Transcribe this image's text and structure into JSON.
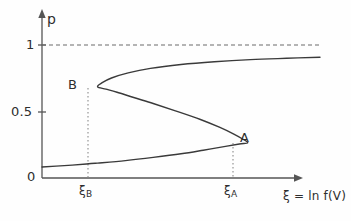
{
  "chart_data": {
    "type": "line",
    "title": "",
    "xlabel": "ξ = ln f(V)",
    "ylabel": "p",
    "xlim": [
      0,
      1
    ],
    "ylim": [
      0,
      1.15
    ],
    "grid": false,
    "legend": null,
    "y_ticks": [
      {
        "value": 1,
        "label": "1"
      },
      {
        "value": 0.5,
        "label": "0.5"
      },
      {
        "value": 0,
        "label": "0"
      }
    ],
    "x_ticks": [
      {
        "label": "ξ",
        "sub": "B",
        "value": 0.2
      },
      {
        "label": "ξ",
        "sub": "A",
        "value": 0.74
      }
    ],
    "annotations": [
      {
        "name": "A",
        "label": "A",
        "x": 0.74,
        "y": 0.265,
        "note": "right fold / turning point"
      },
      {
        "name": "B",
        "label": "B",
        "x": 0.2,
        "y": 0.685,
        "note": "left fold / turning point"
      }
    ],
    "reference_lines": [
      {
        "name": "p-equals-one",
        "orientation": "horizontal",
        "value": 1,
        "style": "dashed"
      },
      {
        "name": "xi-B-dropline",
        "orientation": "vertical",
        "value": 0.2,
        "style": "dotted"
      },
      {
        "name": "xi-A-dropline",
        "orientation": "vertical",
        "value": 0.74,
        "style": "dotted"
      }
    ],
    "series": [
      {
        "name": "s-curve-hysteresis",
        "style": "solid",
        "color": "#3a3a3a",
        "description": "S-shaped multivalued bistable curve with folds at B and A",
        "points": [
          [
            0.0,
            0.083
          ],
          [
            0.08,
            0.093
          ],
          [
            0.16,
            0.105
          ],
          [
            0.2,
            0.112
          ],
          [
            0.3,
            0.131
          ],
          [
            0.4,
            0.155
          ],
          [
            0.5,
            0.182
          ],
          [
            0.58,
            0.209
          ],
          [
            0.66,
            0.238
          ],
          [
            0.71,
            0.256
          ],
          [
            0.74,
            0.265
          ],
          [
            0.72,
            0.295
          ],
          [
            0.69,
            0.33
          ],
          [
            0.64,
            0.38
          ],
          [
            0.57,
            0.44
          ],
          [
            0.48,
            0.505
          ],
          [
            0.4,
            0.56
          ],
          [
            0.33,
            0.605
          ],
          [
            0.27,
            0.645
          ],
          [
            0.23,
            0.668
          ],
          [
            0.2,
            0.685
          ],
          [
            0.215,
            0.715
          ],
          [
            0.25,
            0.752
          ],
          [
            0.31,
            0.79
          ],
          [
            0.39,
            0.824
          ],
          [
            0.5,
            0.853
          ],
          [
            0.62,
            0.874
          ],
          [
            0.75,
            0.89
          ],
          [
            0.88,
            0.9
          ],
          [
            1.0,
            0.908
          ]
        ]
      }
    ]
  },
  "labels": {
    "y_axis_title": "p",
    "x_axis_title": "ξ = ln f(V)",
    "tick_1": "1",
    "tick_05": "0.5",
    "tick_0": "0",
    "xi_symbol": "ξ",
    "sub_b": "B",
    "sub_a": "A",
    "point_a": "A",
    "point_b": "B"
  },
  "colors": {
    "background": "#fefefe",
    "axis": "#555555",
    "curve": "#3a3a3a",
    "dashed": "#6a6a6a",
    "dotted": "#8a8a8a",
    "text": "#2e2e2e"
  }
}
